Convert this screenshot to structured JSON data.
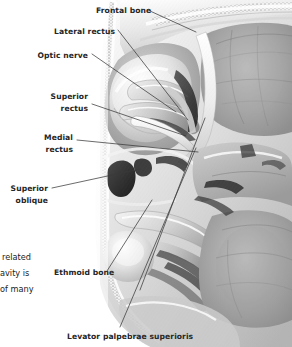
{
  "figure": {
    "style": "grayscale medical illustration",
    "background_color": "#ffffff",
    "label_color": "#262626",
    "leader_color": "#3a3a3a"
  },
  "labels": [
    {
      "id": "frontal-bone",
      "text": "Frontal bone",
      "align": "left",
      "x": 96,
      "y": 5,
      "lines": [
        "Frontal bone"
      ]
    },
    {
      "id": "lateral-rectus",
      "text": "Lateral rectus",
      "align": "right",
      "x": 115,
      "y": 26,
      "lines": [
        "Lateral rectus"
      ]
    },
    {
      "id": "optic-nerve",
      "text": "Optic nerve",
      "align": "right",
      "x": 88,
      "y": 50,
      "lines": [
        "Optic nerve"
      ]
    },
    {
      "id": "superior-rectus",
      "text": "Superior rectus",
      "align": "right",
      "x": 88,
      "y": 91,
      "lines": [
        "Superior",
        "rectus"
      ]
    },
    {
      "id": "medial-rectus",
      "text": "Medial rectus",
      "align": "right",
      "x": 73,
      "y": 132,
      "lines": [
        "Medial",
        "rectus"
      ]
    },
    {
      "id": "superior-oblique",
      "text": "Superior oblique",
      "align": "right",
      "x": 48,
      "y": 183,
      "lines": [
        "Superior",
        "oblique"
      ]
    },
    {
      "id": "ethmoid-bone",
      "text": "Ethmoid bone",
      "align": "left",
      "x": 54,
      "y": 267,
      "lines": [
        "Ethmoid bone"
      ]
    },
    {
      "id": "levator-palpebrae-superioris",
      "text": "Levator palpebrae superioris",
      "align": "left",
      "x": 67,
      "y": 331,
      "lines": [
        "Levator palpebrae superioris"
      ]
    }
  ],
  "body_text_fragments": [
    {
      "id": "frag-1",
      "text": "related",
      "x": 2,
      "y": 249
    },
    {
      "id": "frag-2",
      "text": "avity is",
      "x": 0,
      "y": 265
    },
    {
      "id": "frag-3",
      "text": "of many",
      "x": 0,
      "y": 281
    }
  ],
  "leaders": [
    {
      "id": "leader-frontal-bone",
      "from": [
        150,
        11
      ],
      "to": [
        196,
        32
      ]
    },
    {
      "id": "leader-lateral-rectus",
      "from": [
        118,
        30
      ],
      "to": [
        188,
        120
      ]
    },
    {
      "id": "leader-optic-nerve",
      "from": [
        92,
        54
      ],
      "to": [
        176,
        112
      ]
    },
    {
      "id": "leader-superior-rectus",
      "from": [
        92,
        104
      ],
      "to": [
        186,
        136
      ]
    },
    {
      "id": "leader-medial-rectus",
      "from": [
        77,
        140
      ],
      "to": [
        198,
        152
      ]
    },
    {
      "id": "leader-superior-oblique",
      "from": [
        52,
        188
      ],
      "to": [
        140,
        169
      ]
    },
    {
      "id": "leader-ethmoid-bone",
      "from": [
        107,
        271
      ],
      "to": [
        152,
        200
      ]
    },
    {
      "id": "leader-levator",
      "from": [
        120,
        327
      ],
      "to": [
        196,
        148
      ]
    },
    {
      "id": "leader-levator-b",
      "from": [
        140,
        290
      ],
      "to": [
        205,
        118
      ]
    }
  ]
}
